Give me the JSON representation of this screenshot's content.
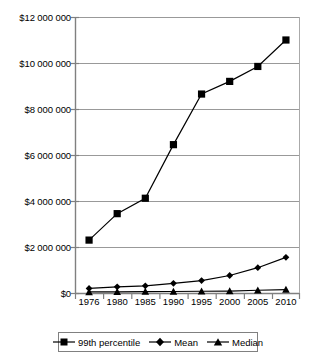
{
  "chart_data": {
    "type": "line",
    "title": "",
    "subtitle": "",
    "xlabel": "",
    "ylabel": "",
    "categories": [
      "1976",
      "1980",
      "1985",
      "1990",
      "1995",
      "2000",
      "2005",
      "2010"
    ],
    "x": [
      1976,
      1980,
      1985,
      1990,
      1995,
      2000,
      2005,
      2010
    ],
    "series": [
      {
        "name": "99th percentile",
        "marker": "square",
        "values": [
          2300000,
          3450000,
          4120000,
          6450000,
          8650000,
          9200000,
          9850000,
          11000000
        ]
      },
      {
        "name": "Mean",
        "marker": "diamond",
        "values": [
          200000,
          270000,
          310000,
          420000,
          540000,
          760000,
          1100000,
          1550000
        ]
      },
      {
        "name": "Median",
        "marker": "triangle",
        "values": [
          45000,
          50000,
          60000,
          65000,
          75000,
          85000,
          120000,
          150000
        ]
      }
    ],
    "ylim": [
      0,
      12000000
    ],
    "ytick_values": [
      0,
      2000000,
      4000000,
      6000000,
      8000000,
      10000000,
      12000000
    ],
    "ytick_labels": [
      "$0",
      "$2 000 000",
      "$4 000 000",
      "$6 000 000",
      "$8 000 000",
      "$10 000 000",
      "$12 000 000"
    ],
    "grid": true,
    "grid_axis": "y",
    "legend_position": "bottom",
    "legend_entries": [
      "99th percentile",
      "Mean",
      "Median"
    ],
    "colors": {
      "series_line": "#000000",
      "marker": "#000000",
      "gridline": "#999999",
      "axis": "#808080",
      "legend_border": "#808080",
      "background": "#ffffff"
    }
  }
}
